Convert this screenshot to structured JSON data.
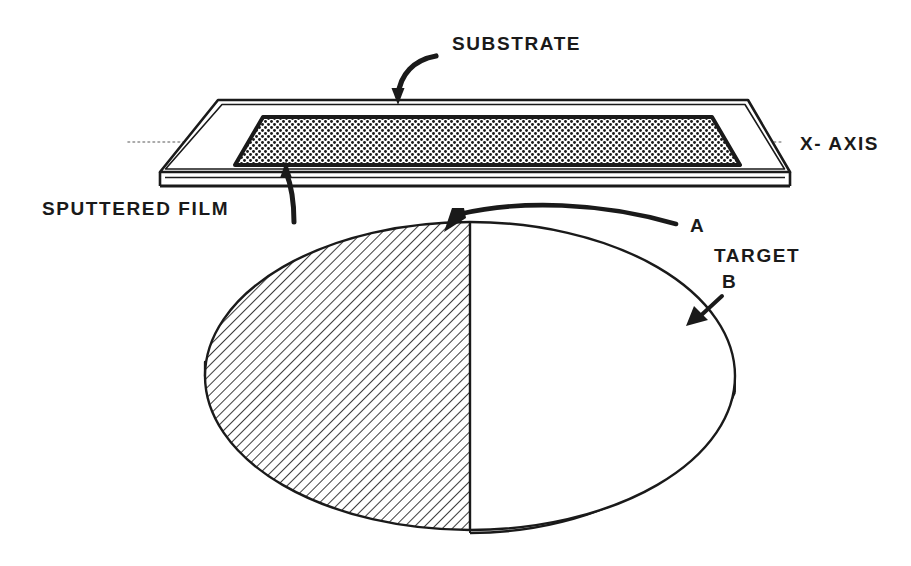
{
  "figure": {
    "background_color": "#ffffff",
    "ink_color": "#1a1a1a",
    "width": 911,
    "height": 566
  },
  "labels": {
    "substrate": "SUBSTRATE",
    "sputtered_film": "SPUTTERED FILM",
    "x_axis": "X- AXIS",
    "point_a": "A",
    "target": "TARGET",
    "point_b": "B"
  },
  "parts": {
    "substrate_plate": {
      "name": "substrate",
      "description": "flat rectangular plate drawn in perspective as a parallelogram slab with thickness"
    },
    "film_layer": {
      "name": "sputtered-film",
      "description": "stippled dotted rectangular deposit on the top face of the substrate"
    },
    "target_disc": {
      "name": "target",
      "description": "circular target disc drawn as an ellipse with an edge thickness; left half hatched, right half blank",
      "hatched_half": "left",
      "plain_half": "right",
      "divider": "vertical center line"
    }
  },
  "annotations": [
    {
      "id": "substrate-callout",
      "label": "SUBSTRATE",
      "style": "curved arrow pointing down to the substrate top surface"
    },
    {
      "id": "film-callout",
      "label": "SPUTTERED FILM",
      "style": "curved leader line rising to the underside of the sputtered film"
    },
    {
      "id": "axis-callout",
      "label": "X- AXIS",
      "style": "dotted horizontal centre line through the substrate"
    },
    {
      "id": "a-callout",
      "label": "A",
      "style": "long curved arrow sweeping left to the top of the hatched half of the target"
    },
    {
      "id": "b-callout",
      "label": "B",
      "style": "short straight arrow pointing down-left onto the right rim of the target"
    }
  ]
}
